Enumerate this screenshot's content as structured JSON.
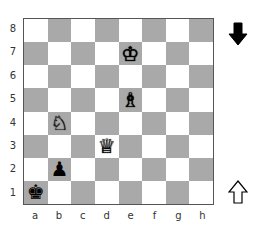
{
  "board": {
    "ranks": [
      "8",
      "7",
      "6",
      "5",
      "4",
      "3",
      "2",
      "1"
    ],
    "files": [
      "a",
      "b",
      "c",
      "d",
      "e",
      "f",
      "g",
      "h"
    ],
    "light_color": "#ffffff",
    "dark_color": "#a9a9a9",
    "pieces": [
      {
        "square": "e7",
        "color": "white",
        "type": "king",
        "glyph": "♔"
      },
      {
        "square": "e5",
        "color": "white",
        "type": "bishop",
        "glyph": "♗"
      },
      {
        "square": "b4",
        "color": "white",
        "type": "knight",
        "glyph": "♘"
      },
      {
        "square": "d3",
        "color": "white",
        "type": "queen",
        "glyph": "♕"
      },
      {
        "square": "b2",
        "color": "black",
        "type": "pawn",
        "glyph": "♟"
      },
      {
        "square": "a1",
        "color": "black",
        "type": "king",
        "glyph": "♚"
      }
    ]
  },
  "indicators": {
    "top": {
      "icon": "black-down-arrow",
      "meaning": "black side"
    },
    "bottom": {
      "icon": "white-up-arrow",
      "meaning": "white side"
    }
  }
}
